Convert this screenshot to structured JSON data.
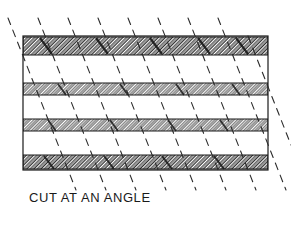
{
  "figure": {
    "caption": "CUT AT AN ANGLE",
    "title": "CUT AT AN ANGLE",
    "colors": {
      "outline": "#1a1a1a",
      "hatch": "#1a1a1a",
      "cut_line": "#2b2b2b",
      "background": "#ffffff",
      "band_fill": "#ffffff",
      "caption": "#1a1a1a"
    },
    "body": {
      "label": "laminate-cross-section",
      "x": 23,
      "y": 36,
      "width": 245,
      "height": 134,
      "outline_width": 1
    },
    "bands": [
      {
        "name": "ply-1",
        "y": 37,
        "height": 18
      },
      {
        "name": "ply-2",
        "y": 83,
        "height": 12
      },
      {
        "name": "ply-3",
        "y": 119,
        "height": 12
      },
      {
        "name": "ply-4",
        "y": 155,
        "height": 14
      }
    ],
    "hatch": {
      "angle_deg": 45,
      "spacing": 2.2,
      "stroke_width": 0.9
    },
    "cut_lines": {
      "count": 9,
      "angle_deg": 68,
      "x_spacing": 30,
      "x_start": 14,
      "dash_pattern": "7 6",
      "stroke_width": 1.1,
      "y_top": 18,
      "y_bottom": 190
    }
  }
}
